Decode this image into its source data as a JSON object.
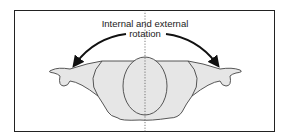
{
  "diagram": {
    "caption_line1": "Internal and external",
    "caption_line2": "rotation",
    "shape_fill": "#e6e6e6",
    "stroke_color": "#444444",
    "midline": "dotted vertical axis"
  }
}
